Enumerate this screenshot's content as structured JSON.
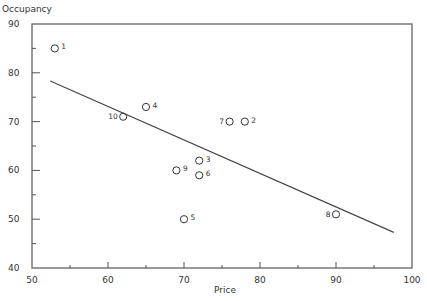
{
  "chart_data": {
    "type": "scatter",
    "title": "",
    "xlabel": "Price",
    "ylabel": "Occupancy",
    "xlim": [
      50,
      100
    ],
    "ylim": [
      40,
      90
    ],
    "grid": false,
    "legend": null,
    "x_major_ticks": [
      50,
      60,
      70,
      80,
      90,
      100
    ],
    "x_minor_ticks": [
      55,
      65,
      75,
      85,
      95
    ],
    "y_major_ticks": [
      40,
      50,
      60,
      70,
      80,
      90
    ],
    "y_minor_ticks": [
      45,
      55,
      65,
      75,
      85
    ],
    "points": [
      {
        "label": "1",
        "x": 53,
        "y": 85
      },
      {
        "label": "2",
        "x": 78,
        "y": 70
      },
      {
        "label": "3",
        "x": 72,
        "y": 62
      },
      {
        "label": "4",
        "x": 65,
        "y": 73
      },
      {
        "label": "5",
        "x": 70,
        "y": 50
      },
      {
        "label": "6",
        "x": 72,
        "y": 59
      },
      {
        "label": "7",
        "x": 76,
        "y": 70
      },
      {
        "label": "8",
        "x": 90,
        "y": 51
      },
      {
        "label": "9",
        "x": 69,
        "y": 60
      },
      {
        "label": "10",
        "x": 62,
        "y": 71
      }
    ],
    "label_side": {
      "1": "right",
      "2": "right",
      "3": "right",
      "4": "right",
      "5": "right",
      "6": "right",
      "7": "left",
      "8": "left",
      "9": "right",
      "10": "left"
    },
    "regression_line": {
      "x1": 52.4,
      "y1": 78.3,
      "x2": 97.6,
      "y2": 47.3
    }
  },
  "colors": {
    "axis": "#555555",
    "marker": "#333333",
    "line": "#444444",
    "text": "#333333"
  }
}
